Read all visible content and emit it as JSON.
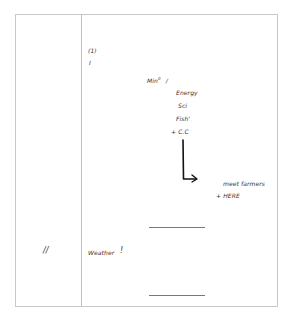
{
  "left_column": {
    "marker": "//"
  },
  "notes": {
    "section_number": "(1)",
    "roman": "I",
    "min_label": "Min",
    "min_sup": "0",
    "min_slash": "/",
    "items": [
      "Energy",
      "Sci",
      "Fish'",
      "+ C.C"
    ],
    "arrow_target": "meet farmers",
    "here_label": "+ HERE",
    "weather_label": "Weather",
    "weather_mark": "!"
  },
  "colors": {
    "border": "#c8c8c8",
    "ink": "#333333",
    "arrow": "#111111",
    "rule": "#777777"
  }
}
